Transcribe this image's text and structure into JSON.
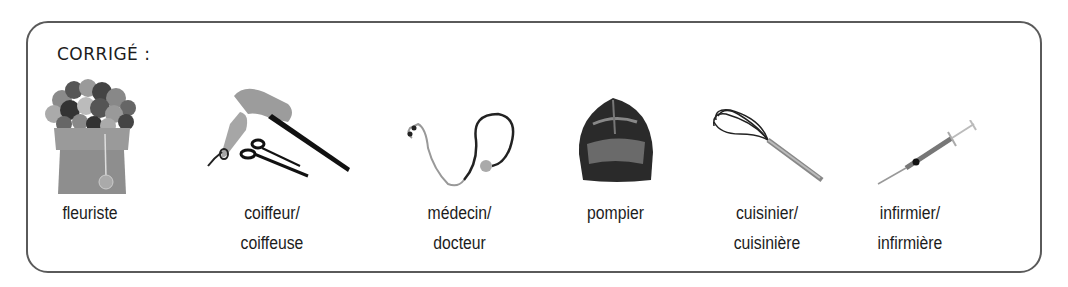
{
  "heading": "CORRIGÉ :",
  "items": [
    {
      "icon": "flower-bouquet-icon",
      "line1": "fleuriste",
      "line2": ""
    },
    {
      "icon": "hairdryer-scissors-comb-icon",
      "line1": "coiffeur/",
      "line2": "coiffeuse"
    },
    {
      "icon": "stethoscope-icon",
      "line1": "médecin/",
      "line2": "docteur"
    },
    {
      "icon": "firefighter-helmet-icon",
      "line1": "pompier",
      "line2": ""
    },
    {
      "icon": "whisk-icon",
      "line1": "cuisinier/",
      "line2": "cuisinière"
    },
    {
      "icon": "syringe-icon",
      "line1": "infirmier/",
      "line2": "infirmière"
    }
  ]
}
